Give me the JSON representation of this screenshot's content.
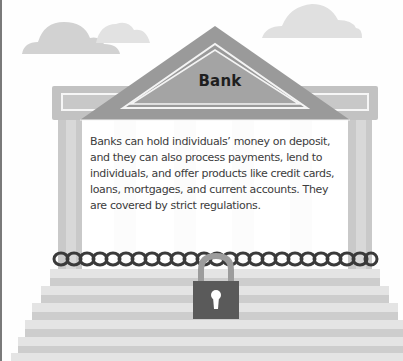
{
  "illustration": {
    "title": "Bank",
    "description": "Banks can hold individuals’ money on deposit, and they can also process payments, lend to individuals, and offer products like credit cards, loans, mortgages, and current accounts. They are covered by strict regulations.",
    "icons": {
      "building": "bank-building",
      "lock": "padlock",
      "chain": "chain",
      "clouds": "cloud"
    },
    "colors": {
      "pediment": "#9a9a9a",
      "pediment_inner": "#a8a8a8",
      "entablature": "#c2c2c2",
      "column_dark": "#c9c9c9",
      "column_light": "#dcdcdc",
      "cloud": "#d2d2d2",
      "step_light": "#e4e4e4",
      "step_dark": "#cdcdcd",
      "chain": "#3a3a3a",
      "lock_body": "#5a5a5a",
      "lock_shackle": "#9c9c9c",
      "text": "#3c3c3c",
      "title": "#1f1f1f"
    }
  }
}
